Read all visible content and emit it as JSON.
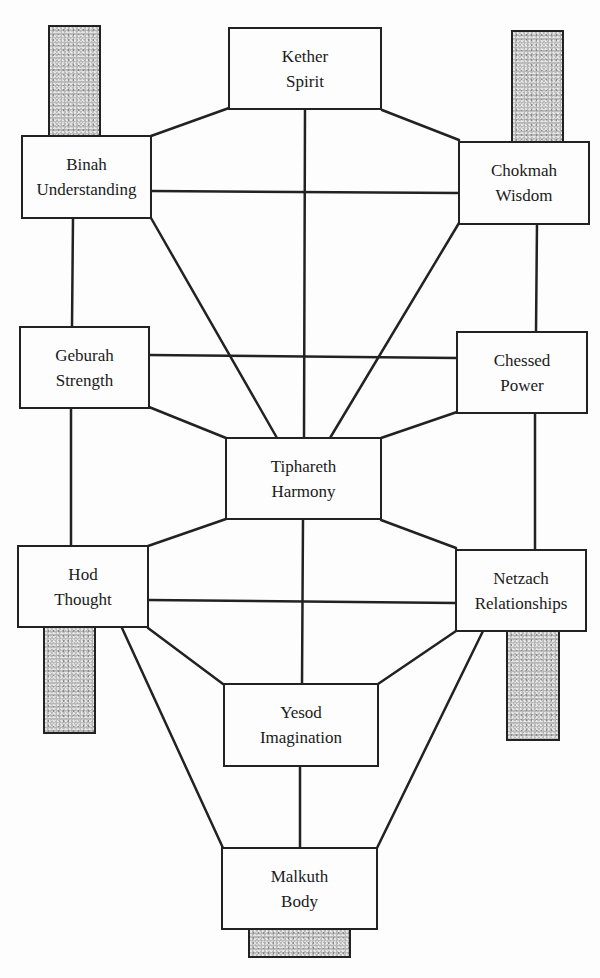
{
  "diagram": {
    "type": "tree-of-life",
    "line_color": "#222222",
    "bar_color": "#b8b8b8",
    "nodes": [
      {
        "id": "kether",
        "name": "Kether",
        "meaning": "Spirit"
      },
      {
        "id": "binah",
        "name": "Binah",
        "meaning": "Understanding"
      },
      {
        "id": "chokmah",
        "name": "Chokmah",
        "meaning": "Wisdom"
      },
      {
        "id": "geburah",
        "name": "Geburah",
        "meaning": "Strength"
      },
      {
        "id": "chessed",
        "name": "Chessed",
        "meaning": "Power"
      },
      {
        "id": "tiphareth",
        "name": "Tiphareth",
        "meaning": "Harmony"
      },
      {
        "id": "hod",
        "name": "Hod",
        "meaning": "Thought"
      },
      {
        "id": "netzach",
        "name": "Netzach",
        "meaning": "Relationships"
      },
      {
        "id": "yesod",
        "name": "Yesod",
        "meaning": "Imagination"
      },
      {
        "id": "malkuth",
        "name": "Malkuth",
        "meaning": "Body"
      }
    ],
    "edges": [
      [
        "kether",
        "binah"
      ],
      [
        "kether",
        "chokmah"
      ],
      [
        "kether",
        "tiphareth"
      ],
      [
        "binah",
        "chokmah"
      ],
      [
        "binah",
        "tiphareth"
      ],
      [
        "chokmah",
        "tiphareth"
      ],
      [
        "binah",
        "geburah"
      ],
      [
        "chokmah",
        "chessed"
      ],
      [
        "geburah",
        "chessed"
      ],
      [
        "geburah",
        "tiphareth"
      ],
      [
        "chessed",
        "tiphareth"
      ],
      [
        "geburah",
        "hod"
      ],
      [
        "chessed",
        "netzach"
      ],
      [
        "tiphareth",
        "hod"
      ],
      [
        "tiphareth",
        "netzach"
      ],
      [
        "tiphareth",
        "yesod"
      ],
      [
        "hod",
        "netzach"
      ],
      [
        "hod",
        "yesod"
      ],
      [
        "hod",
        "malkuth"
      ],
      [
        "netzach",
        "yesod"
      ],
      [
        "netzach",
        "malkuth"
      ],
      [
        "yesod",
        "malkuth"
      ]
    ],
    "shaded_bars": [
      "above-binah",
      "above-chokmah",
      "below-hod",
      "below-netzach",
      "below-malkuth"
    ]
  }
}
